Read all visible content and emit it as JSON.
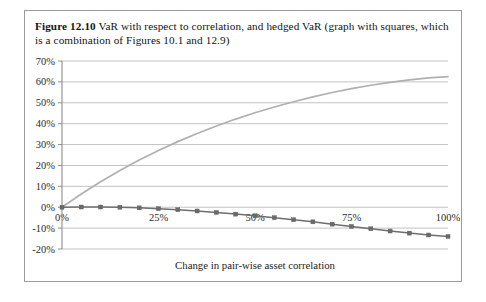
{
  "figure": {
    "label": "Figure 12.10",
    "caption": "VaR with respect to correlation, and hedged VaR (graph with squares, which is a combination of Figures 10.1 and 12.9)"
  },
  "colors": {
    "var_line": "#b0b0b0",
    "hedged_line": "#6e6e6e",
    "marker": "#6b6b6b",
    "gridline": "#b4b4b4",
    "axis": "#8e8e8e",
    "frame": "#9b9b9b",
    "text": "#1a1a1a"
  },
  "chart_data": {
    "type": "line",
    "title": "",
    "xlabel": "Change in pair-wise asset correlation",
    "ylabel": "",
    "xlim": [
      0,
      100
    ],
    "ylim": [
      -20,
      70
    ],
    "grid": true,
    "legend_position": "none",
    "x_tick_labels": [
      "0%",
      "25%",
      "50%",
      "75%",
      "100%"
    ],
    "x_tick_values": [
      0,
      25,
      50,
      75,
      100
    ],
    "y_tick_labels": [
      "-20%",
      "-10%",
      "0%",
      "10%",
      "20%",
      "30%",
      "40%",
      "50%",
      "60%",
      "70%"
    ],
    "y_tick_values": [
      -20,
      -10,
      0,
      10,
      20,
      30,
      40,
      50,
      60,
      70
    ],
    "x": [
      0,
      5,
      10,
      15,
      20,
      25,
      30,
      35,
      40,
      45,
      50,
      55,
      60,
      65,
      70,
      75,
      80,
      85,
      90,
      95,
      100
    ],
    "series": [
      {
        "name": "VaR with respect to correlation",
        "style": "line",
        "color": "#b0b0b0",
        "markers": false,
        "values": [
          0,
          6.3,
          12.2,
          17.6,
          22.6,
          27.2,
          31.4,
          35.3,
          38.9,
          42.2,
          45.2,
          48.0,
          50.5,
          52.8,
          54.9,
          56.8,
          58.4,
          59.8,
          61.0,
          61.9,
          62.5
        ]
      },
      {
        "name": "Hedged VaR",
        "style": "line",
        "color": "#6e6e6e",
        "markers": true,
        "marker_shape": "square",
        "values": [
          0,
          0.1,
          0.1,
          0.0,
          -0.3,
          -0.7,
          -1.2,
          -1.8,
          -2.5,
          -3.3,
          -4.1,
          -5.0,
          -6.0,
          -7.0,
          -8.1,
          -9.2,
          -10.3,
          -11.4,
          -12.4,
          -13.3,
          -14.0
        ]
      }
    ]
  }
}
